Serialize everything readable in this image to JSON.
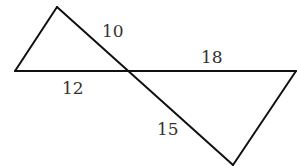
{
  "diagram": {
    "type": "geometry-similar-triangles",
    "points": {
      "top": [
        57,
        7
      ],
      "left": [
        15,
        71
      ],
      "intersection": [
        126,
        71
      ],
      "right": [
        296,
        71
      ],
      "bottom": [
        233,
        166
      ]
    },
    "segments": [
      {
        "id": "top-to-left",
        "from": "top",
        "to": "left"
      },
      {
        "id": "top-to-bottom",
        "from": "top",
        "to": "bottom",
        "through": "intersection"
      },
      {
        "id": "left-to-right",
        "from": "left",
        "to": "right",
        "through": "intersection"
      },
      {
        "id": "right-to-bottom",
        "from": "right",
        "to": "bottom"
      }
    ],
    "labels": {
      "top_to_intersection": "10",
      "left_to_intersection": "12",
      "intersection_to_right": "18",
      "intersection_to_bottom": "15"
    },
    "stroke_color": "#111111",
    "label_color": "#333333"
  }
}
